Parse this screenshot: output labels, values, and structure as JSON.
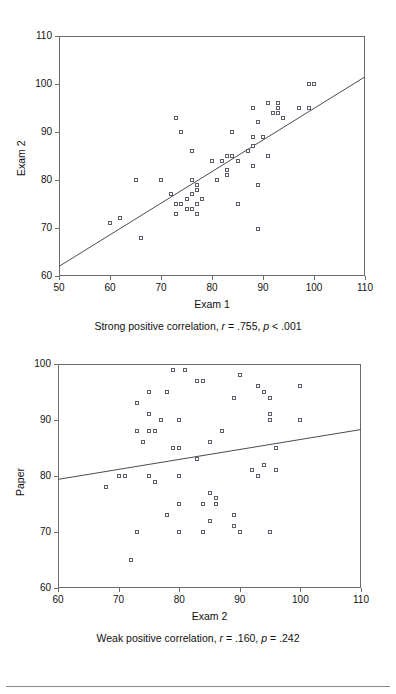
{
  "page": {
    "background": "#ffffff",
    "marker_color": "#5d5d68",
    "axis_color": "#6e6e6e",
    "line_color": "#4a4a52",
    "rule_color": "#8a8a8a"
  },
  "chart_data": [
    {
      "id": "exam1-exam2",
      "type": "scatter",
      "title": "",
      "xlabel": "Exam 1",
      "ylabel": "Exam 2",
      "xlim": [
        50,
        110
      ],
      "ylim": [
        60,
        110
      ],
      "xticks": [
        50,
        60,
        70,
        80,
        90,
        100,
        110
      ],
      "yticks": [
        60,
        70,
        80,
        90,
        100,
        110
      ],
      "grid": false,
      "legend": "none",
      "caption": "Strong positive correlation, r = .755, p < .001",
      "caption_parts": {
        "lead": "Strong positive correlation,",
        "r_symbol": "r",
        "r_value": "= .755,",
        "p_symbol": "p",
        "p_value": "< .001"
      },
      "statistics": {
        "r": 0.755,
        "p_text": "< .001",
        "n": 62
      },
      "fit_line": {
        "x": [
          50,
          110
        ],
        "y": [
          62.0,
          101.5
        ]
      },
      "points": [
        [
          60,
          71
        ],
        [
          62,
          72
        ],
        [
          65,
          80
        ],
        [
          66,
          68
        ],
        [
          70,
          80
        ],
        [
          72,
          77
        ],
        [
          73,
          75
        ],
        [
          73,
          73
        ],
        [
          73,
          93
        ],
        [
          74,
          75
        ],
        [
          74,
          90
        ],
        [
          75,
          76
        ],
        [
          75,
          74
        ],
        [
          76,
          86
        ],
        [
          76,
          80
        ],
        [
          76,
          77
        ],
        [
          76,
          74
        ],
        [
          77,
          79
        ],
        [
          77,
          78
        ],
        [
          77,
          75
        ],
        [
          77,
          73
        ],
        [
          78,
          76
        ],
        [
          80,
          84
        ],
        [
          81,
          80
        ],
        [
          82,
          84
        ],
        [
          83,
          85
        ],
        [
          83,
          82
        ],
        [
          83,
          81
        ],
        [
          84,
          85
        ],
        [
          84,
          90
        ],
        [
          85,
          84
        ],
        [
          85,
          75
        ],
        [
          87,
          86
        ],
        [
          88,
          87
        ],
        [
          88,
          89
        ],
        [
          88,
          95
        ],
        [
          88,
          83
        ],
        [
          89,
          79
        ],
        [
          89,
          92
        ],
        [
          89,
          69.7
        ],
        [
          90,
          89
        ],
        [
          91,
          96
        ],
        [
          91,
          85
        ],
        [
          92,
          94
        ],
        [
          93,
          96
        ],
        [
          93,
          95
        ],
        [
          93,
          94
        ],
        [
          94,
          93
        ],
        [
          97,
          95
        ],
        [
          99,
          95
        ],
        [
          99,
          100
        ],
        [
          100,
          100
        ]
      ]
    },
    {
      "id": "exam2-paper",
      "type": "scatter",
      "title": "",
      "xlabel": "Exam 2",
      "ylabel": "Paper",
      "xlim": [
        60,
        110
      ],
      "ylim": [
        60,
        100
      ],
      "xticks": [
        60,
        70,
        80,
        90,
        100,
        110
      ],
      "yticks": [
        60,
        70,
        80,
        90,
        100
      ],
      "grid": false,
      "legend": "none",
      "caption": "Weak positive correlation, r = .160, p = .242",
      "caption_parts": {
        "lead": "Weak positive correlation,",
        "r_symbol": "r",
        "r_value": "= .160,",
        "p_symbol": "p",
        "p_value": "= .242"
      },
      "statistics": {
        "r": 0.16,
        "p_text": "= .242",
        "n": 55
      },
      "fit_line": {
        "x": [
          60,
          110
        ],
        "y": [
          79.4,
          88.3
        ]
      },
      "points": [
        [
          68,
          78
        ],
        [
          70,
          80
        ],
        [
          71,
          80
        ],
        [
          72,
          65
        ],
        [
          73,
          70
        ],
        [
          73,
          88
        ],
        [
          73,
          93
        ],
        [
          74,
          86
        ],
        [
          75,
          88
        ],
        [
          75,
          91
        ],
        [
          75,
          80
        ],
        [
          75,
          95
        ],
        [
          76,
          88
        ],
        [
          76,
          79
        ],
        [
          77,
          90
        ],
        [
          78,
          73
        ],
        [
          78,
          95
        ],
        [
          79,
          99
        ],
        [
          79,
          85
        ],
        [
          80,
          85
        ],
        [
          80,
          90
        ],
        [
          80,
          70
        ],
        [
          80,
          80
        ],
        [
          80,
          75
        ],
        [
          81,
          99
        ],
        [
          83,
          97
        ],
        [
          83,
          83
        ],
        [
          84,
          97
        ],
        [
          84,
          70
        ],
        [
          84,
          75
        ],
        [
          85,
          72
        ],
        [
          85,
          86
        ],
        [
          85,
          77
        ],
        [
          86,
          76
        ],
        [
          86,
          75
        ],
        [
          87,
          88
        ],
        [
          89,
          73
        ],
        [
          89,
          71
        ],
        [
          89,
          94
        ],
        [
          90,
          98
        ],
        [
          90,
          70
        ],
        [
          92,
          81
        ],
        [
          93,
          80
        ],
        [
          93,
          96
        ],
        [
          94,
          95
        ],
        [
          94,
          82
        ],
        [
          95,
          91
        ],
        [
          95,
          90
        ],
        [
          95,
          94
        ],
        [
          95,
          70
        ],
        [
          96,
          81
        ],
        [
          96,
          85
        ],
        [
          100,
          96
        ],
        [
          100,
          90
        ]
      ]
    }
  ],
  "figures": {
    "top": {
      "axis_x_label": "Exam 1",
      "axis_y_label": "Exam 2",
      "x_tick_labels": [
        "50",
        "60",
        "70",
        "80",
        "90",
        "100",
        "110"
      ],
      "y_tick_labels": [
        "60",
        "70",
        "80",
        "90",
        "100",
        "110"
      ],
      "caption": "Strong positive correlation, r = .755, p < .001"
    },
    "bottom": {
      "axis_x_label": "Exam 2",
      "axis_y_label": "Paper",
      "x_tick_labels": [
        "60",
        "70",
        "80",
        "90",
        "100",
        "110"
      ],
      "y_tick_labels": [
        "60",
        "70",
        "80",
        "90",
        "100"
      ],
      "caption": "Weak positive correlation, r = .160, p = .242"
    }
  }
}
